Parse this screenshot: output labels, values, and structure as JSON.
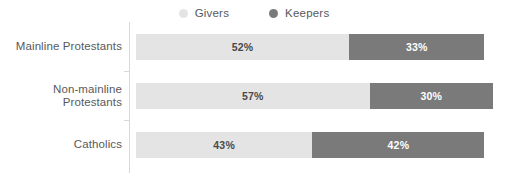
{
  "legend": {
    "position": "top-center",
    "items": [
      {
        "label": "Givers",
        "color": "#e4e4e4",
        "marker": "legend-dot-givers"
      },
      {
        "label": "Keepers",
        "color": "#7a7a7a",
        "marker": "legend-dot-keepers"
      }
    ]
  },
  "chart_data": {
    "type": "bar",
    "orientation": "horizontal",
    "stacked": true,
    "title": "",
    "subtitle": "",
    "xlabel": "",
    "ylabel": "",
    "xlim": [
      0,
      100
    ],
    "grid": false,
    "legend_position": "top-center",
    "categories": [
      "Mainline Protestants",
      "Non-mainline Protestants",
      "Catholics"
    ],
    "series": [
      {
        "name": "Givers",
        "color": "#e4e4e4",
        "values": [
          52,
          57,
          43
        ],
        "labels": [
          "52%",
          "57%",
          "43%"
        ]
      },
      {
        "name": "Keepers",
        "color": "#7a7a7a",
        "values": [
          33,
          30,
          42
        ],
        "labels": [
          "33%",
          "30%",
          "42%"
        ]
      }
    ],
    "rows": [
      {
        "category": "Mainline Protestants",
        "category_line1": "Mainline Protestants",
        "category_line2": "",
        "givers_value": 52,
        "givers_label": "52%",
        "keepers_value": 33,
        "keepers_label": "33%"
      },
      {
        "category": "Non-mainline Protestants",
        "category_line1": "Non-mainline",
        "category_line2": "Protestants",
        "givers_value": 57,
        "givers_label": "57%",
        "keepers_value": 30,
        "keepers_label": "30%"
      },
      {
        "category": "Catholics",
        "category_line1": "Catholics",
        "category_line2": "",
        "givers_value": 43,
        "givers_label": "43%",
        "keepers_value": 42,
        "keepers_label": "42%"
      }
    ]
  },
  "style": {
    "givers_color": "#e4e4e4",
    "keepers_color": "#7a7a7a",
    "axis_color": "#d8d8d8",
    "text_color": "#58595b",
    "givers_label_color": "#4a4a4a",
    "keepers_label_color": "#ffffff",
    "background": "#ffffff",
    "px_per_percent": 4.1
  }
}
